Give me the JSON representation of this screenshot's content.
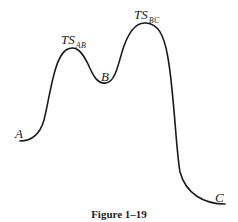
{
  "diagram": {
    "type": "reaction-energy-profile",
    "labels": {
      "start": "A",
      "intermediate": "B",
      "end": "C",
      "ts1_main": "TS",
      "ts1_sub": "AB",
      "ts2_main": "TS",
      "ts2_sub": "BC"
    },
    "caption": "Figure 1–19",
    "stroke_color": "#1a1a1a"
  }
}
